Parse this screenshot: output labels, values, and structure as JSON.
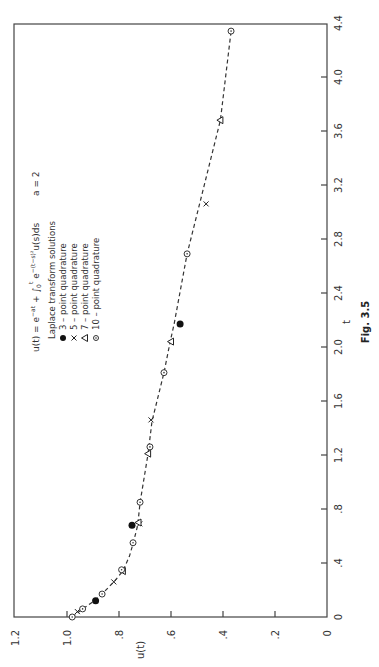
{
  "chart_data": {
    "type": "scatter",
    "title": "Fig. 3.5",
    "equation": "u(t) = e^{-at} + ∫₀ᵗ e^{-(t-s)²} u(s) ds",
    "parameter": "a = 2",
    "xlabel": "t",
    "ylabel": "u(t)",
    "xlim": [
      0,
      4.4
    ],
    "ylim": [
      0,
      1.2
    ],
    "x_ticks": [
      "0",
      ".4",
      ".8",
      "1.2",
      "1.6",
      "2.0",
      "2.4",
      "2.8",
      "3.2",
      "3.6",
      "4.0",
      "4.4"
    ],
    "x_tick_values": [
      0,
      0.4,
      0.8,
      1.2,
      1.6,
      2.0,
      2.4,
      2.8,
      3.2,
      3.6,
      4.0,
      4.4
    ],
    "y_ticks": [
      "0",
      ".2",
      ".4",
      ".6",
      ".8",
      "1.0",
      "1.2"
    ],
    "y_tick_values": [
      0,
      0.2,
      0.4,
      0.6,
      0.8,
      1.0,
      1.2
    ],
    "orientation": "rotated 90° counter-clockwise (t axis vertical on right, u(t) axis horizontal on bottom)",
    "grid": false,
    "legend_title": "Laplace transform solutions",
    "legend_position": "upper-left (in rotated frame)",
    "curve": {
      "name": "exact solution",
      "style": "dashed",
      "x": [
        0,
        0.06,
        0.12,
        0.17,
        0.26,
        0.34,
        0.45,
        0.55,
        0.68,
        0.85,
        1.21,
        1.45,
        1.81,
        2.04,
        2.17,
        2.69,
        3.06,
        3.68,
        4.34
      ],
      "y": [
        0.98,
        0.94,
        0.895,
        0.865,
        0.82,
        0.785,
        0.76,
        0.745,
        0.728,
        0.719,
        0.688,
        0.673,
        0.627,
        0.603,
        0.588,
        0.538,
        0.49,
        0.41,
        0.369
      ]
    },
    "series": [
      {
        "name": "3-point quadrature",
        "marker": "filled-circle",
        "legend_symbol": "●",
        "x": [
          0.12,
          0.68,
          2.17
        ],
        "y": [
          0.89,
          0.75,
          0.565
        ]
      },
      {
        "name": "5-point quadrature",
        "marker": "x",
        "legend_symbol": "x",
        "x": [
          0.04,
          0.26,
          0.69,
          1.46,
          3.06
        ],
        "y": [
          0.96,
          0.82,
          0.72,
          0.677,
          0.465
        ]
      },
      {
        "name": "7-point quadrature",
        "marker": "triangle",
        "legend_symbol": "△",
        "x": [
          0.34,
          0.7,
          1.21,
          2.04,
          3.68
        ],
        "y": [
          0.785,
          0.725,
          0.688,
          0.6,
          0.41
        ]
      },
      {
        "name": "10-point quadrature",
        "marker": "circle-dot",
        "legend_symbol": "⊙",
        "x": [
          0,
          0.06,
          0.17,
          0.35,
          0.55,
          0.85,
          1.26,
          1.81,
          2.69,
          4.34
        ],
        "y": [
          0.98,
          0.94,
          0.865,
          0.79,
          0.746,
          0.719,
          0.681,
          0.627,
          0.538,
          0.369
        ]
      }
    ]
  },
  "labels": {
    "equation": "u(t) = e",
    "a_param": "a = 2",
    "legend_title": "Laplace transform solutions",
    "legend_items": [
      "3 – point quadrature",
      "5 – point quadrature",
      "7 – point quadrature",
      "10 – point quadrature"
    ],
    "xlabel": "t",
    "ylabel": "u(t)",
    "figure": "Fig. 3.5"
  }
}
